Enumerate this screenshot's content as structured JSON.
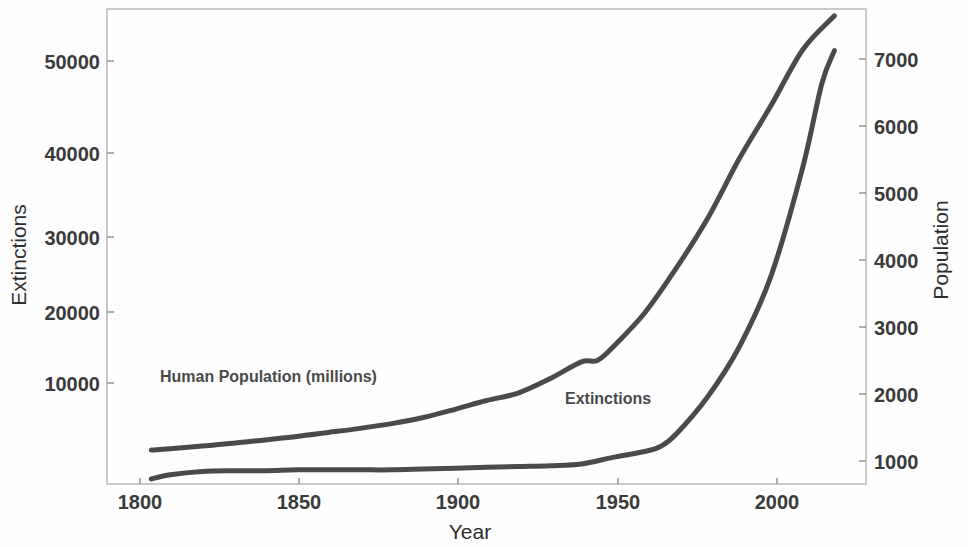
{
  "chart_data": {
    "type": "line",
    "title": "",
    "xlabel": "Year",
    "ylabel": "Extinctions",
    "y2label": "Population",
    "xlim": [
      1790,
      2030
    ],
    "ylim": [
      0,
      57000
    ],
    "y2lim": [
      500,
      7500
    ],
    "grid": false,
    "legend": "inline-annotations",
    "xticks": [
      1800,
      1850,
      1900,
      1950,
      2000
    ],
    "xticklabels": [
      "1800",
      "1850",
      "1900",
      "1950",
      "2000"
    ],
    "yticks": [
      10000,
      20000,
      30000,
      40000,
      50000
    ],
    "yticklabels": [
      "10000",
      "20000",
      "30000",
      "40000",
      "50000"
    ],
    "y2ticks": [
      1000,
      2000,
      3000,
      4000,
      5000,
      6000,
      7000
    ],
    "y2ticklabels": [
      "1000",
      "2000",
      "3000",
      "4000",
      "5000",
      "6000",
      "7000"
    ],
    "series": [
      {
        "name": "Human Population (millions)",
        "axis": "right",
        "color": "#4a4a4a",
        "annotation": "Human Population (millions)",
        "x": [
          1804,
          1810,
          1820,
          1830,
          1840,
          1850,
          1860,
          1870,
          1880,
          1890,
          1900,
          1910,
          1920,
          1930,
          1940,
          1945,
          1950,
          1960,
          1970,
          1980,
          1990,
          2000,
          2010,
          2020
        ],
        "values": [
          1000,
          1020,
          1060,
          1100,
          1150,
          1200,
          1260,
          1320,
          1390,
          1480,
          1600,
          1730,
          1840,
          2050,
          2300,
          2320,
          2520,
          3020,
          3680,
          4420,
          5300,
          6080,
          6900,
          7400
        ]
      },
      {
        "name": "Extinctions",
        "axis": "left",
        "color": "#4a4a4a",
        "annotation": "Extinctions",
        "x": [
          1804,
          1810,
          1820,
          1830,
          1840,
          1850,
          1860,
          1870,
          1880,
          1890,
          1900,
          1910,
          1920,
          1930,
          1940,
          1950,
          1960,
          1965,
          1970,
          1980,
          1990,
          2000,
          2010,
          2016,
          2020
        ],
        "values": [
          600,
          1100,
          1500,
          1600,
          1600,
          1700,
          1700,
          1700,
          1700,
          1800,
          1900,
          2000,
          2100,
          2200,
          2400,
          3200,
          3900,
          4500,
          6000,
          10500,
          16500,
          25000,
          38000,
          48000,
          52000
        ]
      }
    ]
  },
  "axes": {
    "left_title": "Extinctions",
    "right_title": "Population",
    "bottom_title": "Year"
  },
  "annotations": {
    "population_label": "Human Population (millions)",
    "extinctions_label": "Extinctions"
  },
  "colors": {
    "line": "#4a4a4a",
    "frame": "#c9c9c9",
    "text": "#3a3a3a",
    "background": "#fefefe"
  }
}
